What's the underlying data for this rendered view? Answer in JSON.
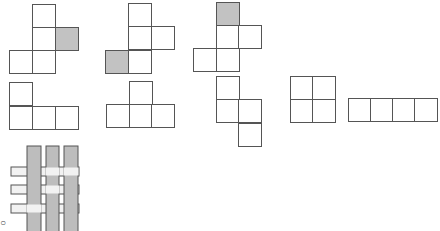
{
  "nets": [
    {
      "name": "net-1",
      "cells": [
        {
          "x": 32,
          "y": 4,
          "s": false
        },
        {
          "x": 32,
          "y": 27,
          "s": false
        },
        {
          "x": 55,
          "y": 27,
          "s": true
        },
        {
          "x": 9,
          "y": 50,
          "s": false
        },
        {
          "x": 32,
          "y": 50,
          "s": false
        }
      ]
    },
    {
      "name": "net-2",
      "cells": [
        {
          "x": 128,
          "y": 3,
          "s": false
        },
        {
          "x": 128,
          "y": 26,
          "s": false
        },
        {
          "x": 151,
          "y": 26,
          "s": false
        },
        {
          "x": 105,
          "y": 50,
          "s": true
        },
        {
          "x": 128,
          "y": 50,
          "s": false
        }
      ]
    },
    {
      "name": "net-3",
      "cells": [
        {
          "x": 216,
          "y": 2,
          "s": true
        },
        {
          "x": 216,
          "y": 25,
          "s": false
        },
        {
          "x": 238,
          "y": 25,
          "s": false
        },
        {
          "x": 193,
          "y": 48,
          "s": false
        },
        {
          "x": 216,
          "y": 48,
          "s": false
        }
      ]
    },
    {
      "name": "net-4",
      "cells": [
        {
          "x": 9,
          "y": 82,
          "s": false
        },
        {
          "x": 9,
          "y": 106,
          "s": false
        },
        {
          "x": 32,
          "y": 106,
          "s": false
        },
        {
          "x": 55,
          "y": 106,
          "s": false
        }
      ]
    },
    {
      "name": "net-5",
      "cells": [
        {
          "x": 129,
          "y": 81,
          "s": false
        },
        {
          "x": 106,
          "y": 104,
          "s": false
        },
        {
          "x": 129,
          "y": 104,
          "s": false
        },
        {
          "x": 151,
          "y": 104,
          "s": false
        }
      ]
    },
    {
      "name": "net-6",
      "cells": [
        {
          "x": 216,
          "y": 76,
          "s": false
        },
        {
          "x": 216,
          "y": 99,
          "s": false
        },
        {
          "x": 238,
          "y": 99,
          "s": false
        },
        {
          "x": 238,
          "y": 123,
          "s": false
        }
      ]
    },
    {
      "name": "net-7",
      "cells": [
        {
          "x": 290,
          "y": 76,
          "s": false
        },
        {
          "x": 312,
          "y": 76,
          "s": false
        },
        {
          "x": 290,
          "y": 99,
          "s": false
        },
        {
          "x": 312,
          "y": 99,
          "s": false
        }
      ]
    },
    {
      "name": "net-8",
      "cells": [
        {
          "x": 348,
          "y": 98,
          "s": false
        },
        {
          "x": 370,
          "y": 98,
          "s": false
        },
        {
          "x": 392,
          "y": 98,
          "s": false
        },
        {
          "x": 414,
          "y": 98,
          "s": false
        }
      ]
    }
  ],
  "cell_size": 23,
  "colors": {
    "line": "#555555",
    "shaded": "#c2c2c2",
    "weave_strip": "#bdbdbd",
    "weave_light": "#f2f2f2"
  },
  "weave": {
    "vertical": [
      {
        "x": 27,
        "w": 14
      },
      {
        "x": 46,
        "w": 13
      },
      {
        "x": 64,
        "w": 14
      }
    ],
    "horizontal": [
      {
        "y": 167,
        "h": 9
      },
      {
        "y": 185,
        "h": 9
      },
      {
        "y": 204,
        "h": 9
      }
    ],
    "x0": 11,
    "x1": 79,
    "y0": 148,
    "y1": 231,
    "over": [
      [
        "v",
        "h",
        "h"
      ],
      [
        "v",
        "h",
        "v"
      ],
      [
        "h",
        "v",
        "v"
      ]
    ]
  },
  "labels": {
    "corner": "○"
  }
}
